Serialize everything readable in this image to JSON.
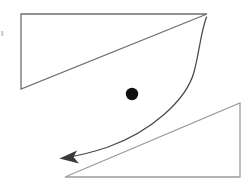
{
  "figure": {
    "background_color": "#ffffff",
    "width": 252,
    "height": 187
  },
  "shapes": {
    "upper_triangle": {
      "name": "upper-left-triangle",
      "stroke_color": "#6f6f6f",
      "stroke_width": 1.3,
      "fill": "none",
      "points": "21,14 207,14 21,89",
      "vertices": [
        {
          "label": "top-left",
          "x": 21,
          "y": 14
        },
        {
          "label": "top-right",
          "x": 207,
          "y": 14
        },
        {
          "label": "bottom-left",
          "x": 21,
          "y": 89
        }
      ],
      "right_angle_at": "top-left"
    },
    "lower_triangle": {
      "name": "lower-right-triangle",
      "stroke_color": "#9c9c9c",
      "stroke_width": 1.3,
      "fill": "none",
      "points": "65,177 240,103 240,177",
      "vertices": [
        {
          "label": "bottom-left",
          "x": 65,
          "y": 177
        },
        {
          "label": "top-right",
          "x": 240,
          "y": 103
        },
        {
          "label": "bottom-right",
          "x": 240,
          "y": 177
        }
      ],
      "right_angle_at": "bottom-right"
    },
    "dot": {
      "name": "black-point-marker",
      "fill_color": "#101010",
      "cx": 132,
      "cy": 94,
      "r": 6.2
    },
    "arrow": {
      "name": "curved-arrow",
      "stroke_color": "#4a4a4a",
      "stroke_width": 1.25,
      "path": "M 206.5,17 C 200.5,33 199.5,52 194,72 C 186,101 150,132 108,147 C 92,152.5 76,156 64,158",
      "start": {
        "x": 206.5,
        "y": 17
      },
      "end": {
        "x": 60,
        "y": 158
      },
      "direction": "from upper-right triangle vertex to lower-left, pointing left-down",
      "head": {
        "name": "arrowhead",
        "fill_color": "#3a3a3a",
        "points": "59.5,158.5 77,150.5 73.5,157 79,163.5"
      }
    },
    "artifact": {
      "name": "left-edge-speck",
      "fill_color": "#c9c9c9",
      "x": 1,
      "y": 31,
      "width": 2.5,
      "height": 5
    }
  },
  "chart_data": {
    "type": "scatter",
    "xlabel": "",
    "ylabel": "",
    "xlim": [
      0,
      252
    ],
    "ylim": [
      0,
      187
    ],
    "grid": false,
    "legend": "none",
    "annotations": [
      {
        "kind": "polygon",
        "name": "upper-left-triangle",
        "points": [
          [
            21,
            14
          ],
          [
            207,
            14
          ],
          [
            21,
            89
          ]
        ],
        "color": "#6f6f6f"
      },
      {
        "kind": "polygon",
        "name": "lower-right-triangle",
        "points": [
          [
            65,
            177
          ],
          [
            240,
            103
          ],
          [
            240,
            177
          ]
        ],
        "color": "#9c9c9c"
      },
      {
        "kind": "point",
        "name": "black-point-marker",
        "x": 132,
        "y": 94,
        "radius": 6.2,
        "color": "#101010"
      },
      {
        "kind": "arrow",
        "name": "curved-arrow",
        "from": [
          206.5,
          17
        ],
        "to": [
          60,
          158
        ],
        "curved": true,
        "color": "#4a4a4a"
      }
    ]
  }
}
